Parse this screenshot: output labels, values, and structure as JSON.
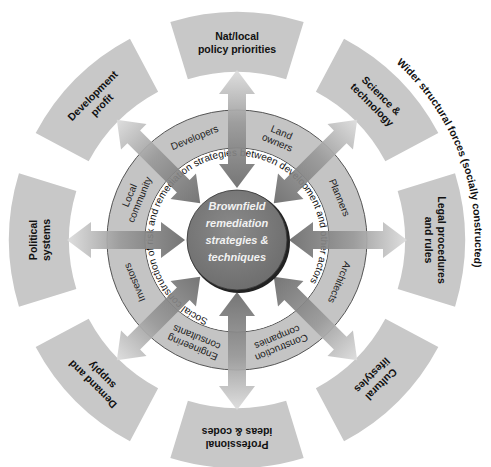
{
  "diagram": {
    "center": {
      "lines": [
        "Brownfield",
        "remediation",
        "strategies &",
        "techniques"
      ]
    },
    "inner_ring_label": "Social construction of risk and remediation strategies between development and other actors",
    "actors": [
      {
        "lines": [
          "Developers"
        ]
      },
      {
        "lines": [
          "Land",
          "owners"
        ]
      },
      {
        "lines": [
          "Planners"
        ]
      },
      {
        "lines": [
          "Architects"
        ]
      },
      {
        "lines": [
          "Construction",
          "companies"
        ]
      },
      {
        "lines": [
          "Engineering",
          "consultants"
        ]
      },
      {
        "lines": [
          "Investors"
        ]
      },
      {
        "lines": [
          "Local",
          "community"
        ]
      }
    ],
    "outer_forces": [
      {
        "lines": [
          "Nat/local",
          "policy priorities"
        ]
      },
      {
        "lines": [
          "Science &",
          "technology"
        ]
      },
      {
        "lines": [
          "Legal procedures",
          "and rules"
        ]
      },
      {
        "lines": [
          "Cultural",
          "lifestyles"
        ]
      },
      {
        "lines": [
          "Professional",
          "ideas & codes"
        ]
      },
      {
        "lines": [
          "Demand and",
          "supply"
        ]
      },
      {
        "lines": [
          "Political",
          "systems"
        ]
      },
      {
        "lines": [
          "Development",
          "profit"
        ]
      }
    ],
    "outer_label": "Wider structural forces (socially constructed)",
    "colors": {
      "segment_fill": "#c8c8c8",
      "actor_ring_fill": "#c4c4c4",
      "center_fill": "#7c7c7c",
      "arrow_dark": "#6e6e6e",
      "arrow_light": "#d8d8d8",
      "background": "#ffffff"
    }
  }
}
